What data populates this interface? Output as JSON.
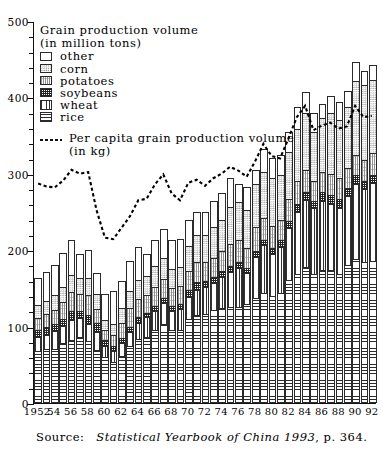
{
  "legend": {
    "title_line1": "Grain production volume",
    "title_line2": "(in million tons)",
    "items": [
      {
        "label": "other",
        "pattern": "p-other"
      },
      {
        "label": "corn",
        "pattern": "p-corn"
      },
      {
        "label": "potatoes",
        "pattern": "p-potatoes"
      },
      {
        "label": "soybeans",
        "pattern": "p-soybeans"
      },
      {
        "label": "wheat",
        "pattern": "p-wheat"
      },
      {
        "label": "rice",
        "pattern": "p-rice"
      }
    ],
    "percapita_line1": "Per capita grain production volume",
    "percapita_line2": "(in kg)"
  },
  "source": {
    "label": "Source:",
    "italic": "Statistical Yearbook of China 1993",
    "tail": ", p. 364."
  },
  "chart_data": {
    "type": "bar",
    "title": "Grain production volume (in million tons)",
    "xlabel": "",
    "ylabel": "",
    "ylim": [
      0,
      500
    ],
    "ytick_values": [
      0,
      100,
      200,
      300,
      400,
      500
    ],
    "ytick_labels": [
      "0",
      "100",
      "200",
      "300",
      "400",
      "500"
    ],
    "yminor_step": 20,
    "grid": false,
    "legend_position": "upper-left",
    "stacked": true,
    "categories": [
      1952,
      1953,
      1954,
      1955,
      1956,
      1957,
      1958,
      1959,
      1960,
      1961,
      1962,
      1963,
      1964,
      1965,
      1966,
      1967,
      1968,
      1969,
      1970,
      1971,
      1972,
      1973,
      1974,
      1975,
      1976,
      1977,
      1978,
      1979,
      1980,
      1981,
      1982,
      1983,
      1984,
      1985,
      1986,
      1987,
      1988,
      1989,
      1990,
      1991,
      1992
    ],
    "xtick_labels": [
      "1952",
      "54",
      "56",
      "58",
      "60",
      "62",
      "64",
      "66",
      "68",
      "70",
      "72",
      "74",
      "76",
      "78",
      "80",
      "82",
      "84",
      "86",
      "88",
      "90",
      "92"
    ],
    "xtick_values": [
      1952,
      1954,
      1956,
      1958,
      1960,
      1962,
      1964,
      1966,
      1968,
      1970,
      1972,
      1974,
      1976,
      1978,
      1980,
      1982,
      1984,
      1986,
      1988,
      1990,
      1992
    ],
    "series": [
      {
        "name": "rice",
        "pattern": "p-rice",
        "values": [
          68,
          71,
          71,
          78,
          83,
          87,
          81,
          70,
          60,
          54,
          62,
          74,
          84,
          87,
          95,
          103,
          95,
          96,
          110,
          115,
          116,
          122,
          124,
          126,
          126,
          129,
          137,
          144,
          140,
          144,
          161,
          169,
          178,
          169,
          174,
          174,
          169,
          180,
          189,
          184,
          186
        ]
      },
      {
        "name": "wheat",
        "pattern": "p-wheat",
        "values": [
          18,
          18,
          23,
          23,
          25,
          24,
          23,
          23,
          14,
          14,
          17,
          19,
          21,
          25,
          25,
          28,
          26,
          27,
          29,
          33,
          36,
          35,
          41,
          45,
          51,
          41,
          54,
          63,
          55,
          60,
          68,
          81,
          88,
          86,
          90,
          86,
          86,
          91,
          98,
          96,
          102
        ]
      },
      {
        "name": "soybeans",
        "pattern": "p-soybeans",
        "values": [
          9,
          10,
          9,
          9,
          12,
          10,
          11,
          12,
          8,
          6,
          6,
          7,
          8,
          6,
          7,
          7,
          6,
          6,
          9,
          10,
          8,
          8,
          8,
          8,
          7,
          7,
          8,
          7,
          8,
          9,
          9,
          10,
          10,
          10,
          12,
          12,
          12,
          10,
          11,
          10,
          10
        ]
      },
      {
        "name": "potatoes",
        "pattern": "p-potatoes",
        "values": [
          16,
          17,
          19,
          22,
          25,
          22,
          26,
          18,
          14,
          15,
          20,
          24,
          23,
          24,
          25,
          24,
          24,
          24,
          25,
          26,
          25,
          25,
          26,
          29,
          29,
          26,
          31,
          28,
          29,
          27,
          29,
          30,
          29,
          26,
          26,
          28,
          27,
          27,
          27,
          28,
          29
        ]
      },
      {
        "name": "corn",
        "pattern": "p-corn",
        "values": [
          17,
          17,
          19,
          20,
          23,
          21,
          23,
          20,
          13,
          14,
          19,
          23,
          25,
          24,
          27,
          28,
          25,
          25,
          33,
          36,
          35,
          41,
          40,
          48,
          50,
          50,
          56,
          60,
          63,
          59,
          61,
          68,
          74,
          64,
          71,
          79,
          77,
          79,
          97,
          98,
          96
        ]
      },
      {
        "name": "other",
        "pattern": "p-other",
        "values": [
          35,
          39,
          39,
          44,
          45,
          31,
          36,
          27,
          34,
          44,
          36,
          39,
          43,
          29,
          35,
          38,
          37,
          37,
          34,
          30,
          30,
          34,
          36,
          38,
          23,
          30,
          19,
          30,
          26,
          26,
          27,
          29,
          28,
          24,
          19,
          23,
          23,
          21,
          24,
          19,
          19
        ]
      }
    ],
    "totals": [
      163,
      172,
      180,
      196,
      213,
      195,
      200,
      170,
      143,
      147,
      160,
      186,
      204,
      195,
      214,
      228,
      213,
      215,
      240,
      250,
      250,
      265,
      275,
      294,
      286,
      283,
      305,
      332,
      321,
      325,
      355,
      387,
      407,
      379,
      392,
      402,
      394,
      408,
      446,
      435,
      442
    ],
    "overlay_line": {
      "name": "Per capita grain production volume (in kg)",
      "unit": "kg",
      "style": "dashed",
      "values": [
        288,
        284,
        283,
        292,
        306,
        301,
        303,
        253,
        217,
        215,
        230,
        245,
        266,
        268,
        287,
        300,
        275,
        266,
        289,
        293,
        285,
        295,
        301,
        310,
        305,
        297,
        317,
        340,
        324,
        321,
        347,
        375,
        390,
        358,
        364,
        368,
        360,
        363,
        390,
        375,
        377
      ]
    }
  }
}
